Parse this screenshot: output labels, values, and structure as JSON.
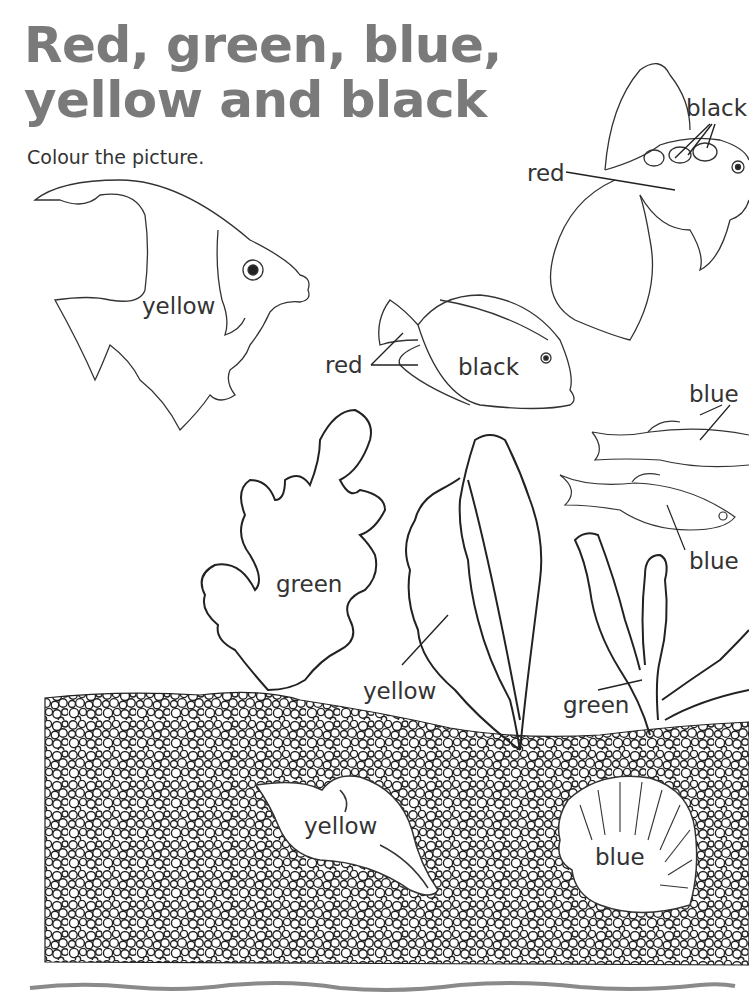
{
  "worksheet": {
    "title_line1": "Red, green, blue,",
    "title_line2": "yellow and black",
    "instruction": "Colour the picture.",
    "title_color": "#7a7a7a"
  },
  "labels": {
    "angelfish_body": "yellow",
    "goldfish_spots": "black",
    "goldfish_body": "red",
    "tang_fins": "red",
    "tang_body": "black",
    "small_fish_top": "blue",
    "small_fish_bottom": "blue",
    "frilly_weed": "green",
    "tall_weed": "yellow",
    "branch_weed": "green",
    "conch_shell": "yellow",
    "scallop_shell": "blue"
  }
}
